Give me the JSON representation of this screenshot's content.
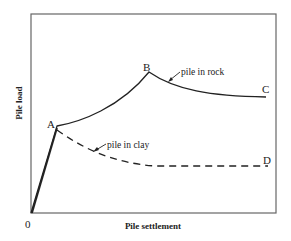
{
  "diagram": {
    "type": "load-settlement curve",
    "x_axis_label": "Pile settlement",
    "y_axis_label": "Pile  load",
    "origin_label": "0",
    "points": {
      "A": "A",
      "B": "B",
      "C": "C",
      "D": "D"
    },
    "curves": [
      {
        "name": "pile-in-rock",
        "label": "pile in rock",
        "style": "solid",
        "path": "0-A-B-C"
      },
      {
        "name": "pile-in-clay",
        "label": "pile in clay",
        "style": "dashed",
        "path": "0-A-D"
      }
    ],
    "colors": {
      "line": "#222222",
      "frame": "#555555"
    }
  }
}
